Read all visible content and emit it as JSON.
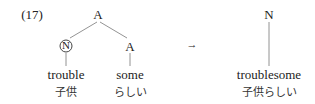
{
  "example_number": "(17)",
  "left_tree": {
    "root": "A",
    "left_child": {
      "label": "N",
      "circled": true,
      "word": "trouble",
      "gloss": "子供"
    },
    "right_child": {
      "label": "A",
      "circled": false,
      "word": "some",
      "gloss": "らしい"
    }
  },
  "arrow": "→",
  "right_tree": {
    "root": "N",
    "word": "troublesome",
    "gloss": "子供らしい"
  }
}
